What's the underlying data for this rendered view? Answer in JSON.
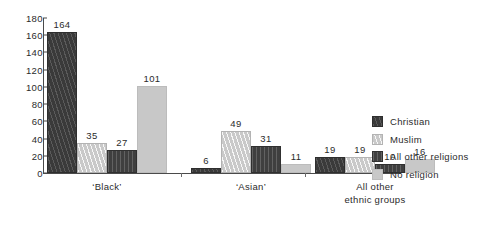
{
  "chart_data": {
    "type": "bar",
    "title": "",
    "subtitle": "",
    "xlabel": "",
    "ylabel": "",
    "ylim": [
      0,
      180
    ],
    "ytick_step": 20,
    "yticks": [
      "0",
      "20",
      "40",
      "60",
      "80",
      "100",
      "120",
      "140",
      "160",
      "180"
    ],
    "grid": false,
    "legend_position": "right",
    "categories": [
      "‘Black’",
      "‘Asian’",
      "All other\nethnic groups"
    ],
    "series": [
      {
        "name": "Christian",
        "values": [
          164,
          6,
          19
        ],
        "swatch": "dark-diagonal-hatch",
        "color": "#3a3a3a"
      },
      {
        "name": "Muslim",
        "values": [
          35,
          49,
          19
        ],
        "swatch": "light-diagonal-hatch",
        "color": "#c9c9c9"
      },
      {
        "name": "All other religions",
        "values": [
          27,
          31,
          10
        ],
        "swatch": "dark-vertical-hatch",
        "color": "#3f3f3f"
      },
      {
        "name": "No religion",
        "values": [
          101,
          11,
          16
        ],
        "swatch": "light-solid",
        "color": "#c8c8c8"
      }
    ],
    "bar_labels": [
      [
        "164",
        "35",
        "27",
        "101"
      ],
      [
        "6",
        "49",
        "31",
        "11"
      ],
      [
        "19",
        "19",
        "10",
        "16"
      ]
    ]
  }
}
